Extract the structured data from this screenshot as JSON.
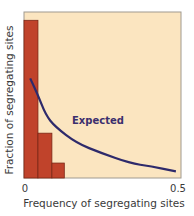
{
  "chart_data": {
    "type": "bar",
    "title": "",
    "xlabel": "Frequency of segregating sites",
    "ylabel": "Fraction of segregating sites",
    "xlim": [
      0,
      0.5
    ],
    "ylim": [
      0,
      1
    ],
    "x_tick_labels": [
      "0",
      "0.5"
    ],
    "y_tick_labels": [],
    "grid": false,
    "legend": null,
    "series": [
      {
        "name": "Observed",
        "type": "bar",
        "bin_edges": [
          0,
          0.045,
          0.09,
          0.13
        ],
        "values": [
          0.95,
          0.27,
          0.09
        ],
        "color": "#c0432b"
      },
      {
        "name": "Expected",
        "type": "line",
        "x": [
          0.02,
          0.045,
          0.07,
          0.1,
          0.17,
          0.25,
          0.34,
          0.41,
          0.49
        ],
        "y": [
          0.6,
          0.5,
          0.38,
          0.31,
          0.21,
          0.15,
          0.09,
          0.07,
          0.04
        ],
        "color": "#2e2a6b"
      }
    ],
    "annotations": [
      {
        "text": "Expected",
        "x": 0.16,
        "y": 0.36
      }
    ],
    "plot_background": "#fbe5c0"
  },
  "labels": {
    "xlabel": "Frequency of segregating sites",
    "ylabel": "Fraction of segregating sites",
    "tick_0": "0",
    "tick_05": "0.5",
    "annotation": "Expected"
  }
}
